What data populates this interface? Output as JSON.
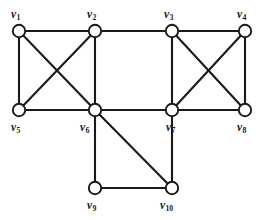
{
  "figure": {
    "kind": "undirected-graph-diagram",
    "width": 266,
    "height": 220,
    "background_color": "#ffffff",
    "line_color": "#1a1a1a",
    "vertex_fill_color": "#ffffff",
    "vertex_stroke_color": "#1a1a1a",
    "vertex_radius": 6.2,
    "line_width": 2.1
  },
  "chart_data": {
    "type": "diagram",
    "title": "",
    "nodes": [
      {
        "id": "v1",
        "letter": "v",
        "index": "1",
        "x": 19,
        "y": 31,
        "label_x": 11,
        "label_y": 9,
        "degree": 4
      },
      {
        "id": "v2",
        "letter": "v",
        "index": "2",
        "x": 95,
        "y": 31,
        "label_x": 87,
        "label_y": 9,
        "degree": 4
      },
      {
        "id": "v3",
        "letter": "v",
        "index": "3",
        "x": 172,
        "y": 31,
        "label_x": 164,
        "label_y": 9,
        "degree": 4
      },
      {
        "id": "v4",
        "letter": "v",
        "index": "4",
        "x": 245,
        "y": 31,
        "label_x": 237,
        "label_y": 9,
        "degree": 3
      },
      {
        "id": "v5",
        "letter": "v",
        "index": "5",
        "x": 19,
        "y": 110,
        "label_x": 11,
        "label_y": 122,
        "degree": 3
      },
      {
        "id": "v6",
        "letter": "v",
        "index": "6",
        "x": 95,
        "y": 110,
        "label_x": 80,
        "label_y": 122,
        "degree": 6
      },
      {
        "id": "v7",
        "letter": "v",
        "index": "7",
        "x": 172,
        "y": 110,
        "label_x": 166,
        "label_y": 122,
        "degree": 5
      },
      {
        "id": "v8",
        "letter": "v",
        "index": "8",
        "x": 245,
        "y": 110,
        "label_x": 237,
        "label_y": 122,
        "degree": 3
      },
      {
        "id": "v9",
        "letter": "v",
        "index": "9",
        "x": 95,
        "y": 188,
        "label_x": 87,
        "label_y": 200,
        "degree": 2
      },
      {
        "id": "v10",
        "letter": "v",
        "index": "10",
        "x": 172,
        "y": 188,
        "label_x": 160,
        "label_y": 200,
        "degree": 3
      }
    ],
    "edges": [
      {
        "from": "v1",
        "to": "v2",
        "style": "top-horizontal"
      },
      {
        "from": "v1",
        "to": "v5",
        "style": "left-vertical"
      },
      {
        "from": "v1",
        "to": "v6",
        "style": "diagonal"
      },
      {
        "from": "v2",
        "to": "v5",
        "style": "diagonal"
      },
      {
        "from": "v2",
        "to": "v6",
        "style": "vertical"
      },
      {
        "from": "v5",
        "to": "v6",
        "style": "horizontal"
      },
      {
        "from": "v2",
        "to": "v3",
        "style": "top-horizontal"
      },
      {
        "from": "v3",
        "to": "v4",
        "style": "top-horizontal"
      },
      {
        "from": "v3",
        "to": "v7",
        "style": "vertical"
      },
      {
        "from": "v3",
        "to": "v8",
        "style": "diagonal"
      },
      {
        "from": "v4",
        "to": "v7",
        "style": "diagonal"
      },
      {
        "from": "v4",
        "to": "v8",
        "style": "right-vertical"
      },
      {
        "from": "v7",
        "to": "v8",
        "style": "horizontal"
      },
      {
        "from": "v6",
        "to": "v7",
        "style": "horizontal"
      },
      {
        "from": "v6",
        "to": "v9",
        "style": "vertical"
      },
      {
        "from": "v6",
        "to": "v10",
        "style": "diagonal"
      },
      {
        "from": "v9",
        "to": "v10",
        "style": "bottom-horizontal"
      },
      {
        "from": "v7",
        "to": "v10",
        "style": "vertical"
      }
    ],
    "node_count": 10,
    "edge_count": 18
  }
}
